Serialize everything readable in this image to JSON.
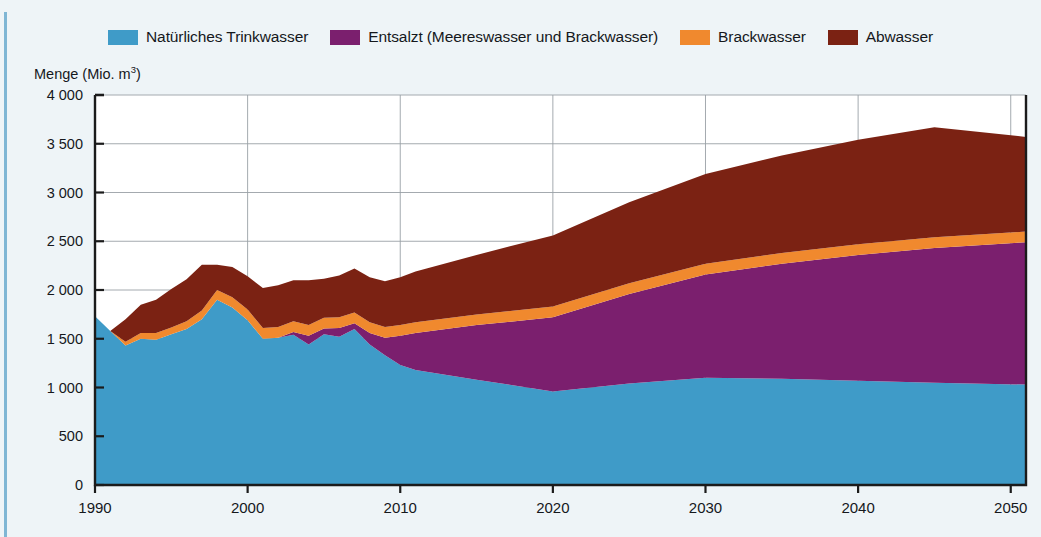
{
  "legend": {
    "items": [
      {
        "label": "Natürliches Trinkwasser",
        "color": "#3f9bc8",
        "key": "natural"
      },
      {
        "label": "Entsalzt (Meereswasser und Brackwasser)",
        "color": "#7b1f6e",
        "key": "desalinated"
      },
      {
        "label": "Brackwasser",
        "color": "#f0892e",
        "key": "brackish"
      },
      {
        "label": "Abwasser",
        "color": "#7b2213",
        "key": "wastewater"
      }
    ]
  },
  "axis": {
    "y_title": "Menge (Mio. m",
    "y_title_sup": "3",
    "y_title_close": ")",
    "y_ticks": [
      "4 000",
      "3 500",
      "3 000",
      "2 500",
      "2 000",
      "1 500",
      "1 000",
      "500",
      "0"
    ],
    "x_ticks": [
      "1990",
      "2000",
      "2010",
      "2020",
      "2030",
      "2040",
      "2050"
    ]
  },
  "colors": {
    "natural": "#3f9bc8",
    "desalinated": "#7b1f6e",
    "brackish": "#f0892e",
    "wastewater": "#7b2213",
    "background": "#eef4f7",
    "plot_background": "#ffffff",
    "grid": "#9aa0a6",
    "frame": "#1b1b1b",
    "text": "#15181c"
  },
  "chart_data": {
    "type": "area",
    "stacked": true,
    "title": "",
    "xlabel": "",
    "ylabel": "Menge (Mio. m3)",
    "ylim": [
      0,
      4000
    ],
    "xlim": [
      1990,
      2051
    ],
    "grid": true,
    "legend_position": "top",
    "ytick_values": [
      0,
      500,
      1000,
      1500,
      2000,
      2500,
      3000,
      3500,
      4000
    ],
    "xtick_values": [
      1990,
      2000,
      2010,
      2020,
      2030,
      2040,
      2050
    ],
    "x": [
      1990,
      1991,
      1992,
      1993,
      1994,
      1995,
      1996,
      1997,
      1998,
      1999,
      2000,
      2001,
      2002,
      2003,
      2004,
      2005,
      2006,
      2007,
      2008,
      2009,
      2010,
      2011,
      2015,
      2020,
      2025,
      2030,
      2035,
      2040,
      2045,
      2051
    ],
    "series": [
      {
        "name": "Natürliches Trinkwasser",
        "color": "#3f9bc8",
        "values": [
          1730,
          1580,
          1430,
          1500,
          1490,
          1545,
          1600,
          1700,
          1900,
          1820,
          1690,
          1500,
          1510,
          1540,
          1440,
          1545,
          1520,
          1600,
          1440,
          1330,
          1230,
          1180,
          1080,
          960,
          1040,
          1100,
          1090,
          1070,
          1050,
          1030
        ]
      },
      {
        "name": "Entsalzt (Meereswasser und Brackwasser)",
        "color": "#7b1f6e",
        "values": [
          0,
          0,
          0,
          0,
          0,
          0,
          0,
          0,
          0,
          0,
          0,
          0,
          0,
          30,
          90,
          60,
          90,
          60,
          120,
          180,
          300,
          380,
          560,
          760,
          920,
          1060,
          1180,
          1290,
          1380,
          1460
        ]
      },
      {
        "name": "Brackwasser",
        "color": "#f0892e",
        "values": [
          0,
          0,
          40,
          60,
          70,
          70,
          80,
          90,
          100,
          105,
          110,
          110,
          110,
          110,
          110,
          110,
          110,
          110,
          110,
          110,
          110,
          110,
          110,
          110,
          110,
          110,
          110,
          110,
          110,
          110
        ]
      },
      {
        "name": "Abwasser",
        "color": "#7b2213",
        "values": [
          0,
          0,
          230,
          290,
          340,
          395,
          430,
          470,
          260,
          310,
          340,
          410,
          430,
          420,
          460,
          400,
          430,
          450,
          460,
          470,
          490,
          520,
          610,
          730,
          830,
          920,
          1000,
          1070,
          1130,
          970
        ]
      }
    ]
  }
}
